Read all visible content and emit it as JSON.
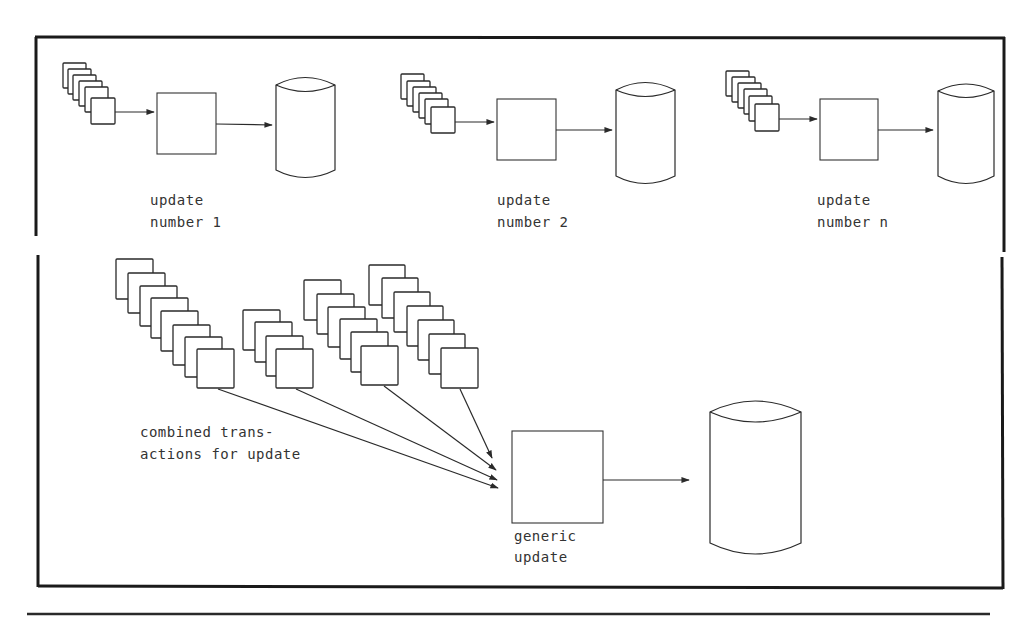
{
  "diagram": {
    "top_panel": {
      "updates": [
        {
          "label_line1": "update",
          "label_line2": "number 1",
          "card_count": 6
        },
        {
          "label_line1": "update",
          "label_line2": "number 2",
          "card_count": 6
        },
        {
          "label_line1": "update",
          "label_line2": "number n",
          "card_count": 6
        }
      ]
    },
    "bottom_panel": {
      "transactions_label_line1": "combined trans-",
      "transactions_label_line2": "actions for update",
      "process_label_line1": "generic",
      "process_label_line2": "update",
      "stacks": [
        {
          "card_count": 8
        },
        {
          "card_count": 4
        },
        {
          "card_count": 6
        },
        {
          "card_count": 7
        }
      ]
    },
    "colors": {
      "line": "#2a2a2a",
      "text": "#333333",
      "background": "#ffffff"
    }
  }
}
